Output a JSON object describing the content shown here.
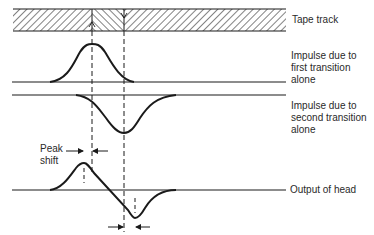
{
  "diagram": {
    "labels": {
      "tape_track": "Tape track",
      "impulse_first": "Impulse due to\nfirst transition\nalone",
      "impulse_second": "Impulse due to\nsecond transition\nalone",
      "output": "Output of head",
      "peak_shift": "Peak\nshift"
    },
    "colors": {
      "stroke": "#1a1a1a",
      "text": "#2a2a2a",
      "background": "#ffffff"
    }
  }
}
